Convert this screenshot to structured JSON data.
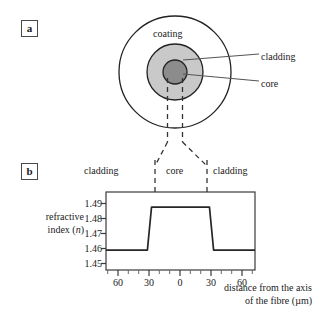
{
  "figure": {
    "panels": [
      {
        "id": "a",
        "label": "a"
      },
      {
        "id": "b",
        "label": "b"
      }
    ]
  },
  "panel_a": {
    "label": "a",
    "regions": [
      {
        "name": "coating",
        "label": "coating",
        "fill": "#ffffff",
        "radius_px": 56
      },
      {
        "name": "cladding",
        "label": "cladding",
        "fill": "#c9c9c9",
        "radius_px": 28
      },
      {
        "name": "core",
        "label": "core",
        "fill": "#8c8c8c",
        "radius_px": 12
      }
    ],
    "callouts": [
      {
        "name": "cladding",
        "label": "cladding"
      },
      {
        "name": "core",
        "label": "core"
      }
    ],
    "inner_label": "coating"
  },
  "panel_b": {
    "label": "b",
    "region_labels": {
      "left": "cladding",
      "middle": "core",
      "right": "cladding"
    }
  },
  "chart_data": {
    "type": "line",
    "title": "",
    "xlabel": "distance from the axis of the fibre (µm)",
    "xlabel_line1": "distance from the axis",
    "xlabel_line2": "of the fibre (µm)",
    "ylabel": "refractive index (n)",
    "ylabel_line1": "refractive",
    "ylabel_line2": "index (n)",
    "ylabel_italic": "n",
    "xlim": [
      -72,
      72
    ],
    "ylim": [
      1.4445,
      1.4935
    ],
    "yticks": [
      1.49,
      1.48,
      1.47,
      1.46,
      1.45
    ],
    "ytick_labels": [
      "1.49",
      "1.48",
      "1.47",
      "1.46",
      "1.45"
    ],
    "xticks": [
      -60,
      -30,
      0,
      30,
      60
    ],
    "xtick_labels": [
      "60",
      "30",
      "0",
      "30",
      "60"
    ],
    "xminor_step": 10,
    "grid": false,
    "legend": null,
    "series": [
      {
        "name": "refractive index profile",
        "color": "#262626",
        "description": "step-index profile: raised plateau across the core, lower constant value in the cladding",
        "x": [
          -72,
          -32,
          -30,
          -28,
          28,
          30,
          32,
          72
        ],
        "y": [
          1.457,
          1.457,
          1.4705,
          1.484,
          1.484,
          1.4705,
          1.457,
          1.457
        ]
      }
    ],
    "annotations": {
      "cladding_index": 1.457,
      "core_index": 1.484,
      "core_half_width_um": 30
    }
  },
  "colors": {
    "line": "#262626",
    "axis": "#3a3a3a",
    "cladding_fill": "#c9c9c9",
    "core_fill": "#8c8c8c",
    "text": "#1a1a1a",
    "dashed": "#333333"
  }
}
